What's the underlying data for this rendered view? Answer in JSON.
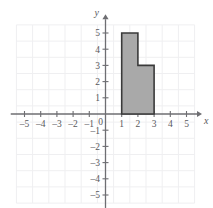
{
  "chart_data": {
    "type": "area",
    "title": "",
    "xlabel": "x",
    "ylabel": "y",
    "xlim": [
      -5.9,
      5.9
    ],
    "ylim": [
      -5.6,
      5.6
    ],
    "grid": true,
    "legend": "none",
    "x_ticks": [
      -5,
      -4,
      -3,
      -2,
      -1,
      1,
      2,
      3,
      4,
      5
    ],
    "y_ticks": [
      -5,
      -4,
      -3,
      -2,
      -1,
      1,
      2,
      3,
      4,
      5
    ],
    "x_tick_labels": [
      "–5",
      "–4",
      "–3",
      "–2",
      "–1",
      "1",
      "2",
      "3",
      "4",
      "5"
    ],
    "y_tick_labels": [
      "–5",
      "–4",
      "–3",
      "–2",
      "–1",
      "1",
      "2",
      "3",
      "4",
      "5"
    ],
    "origin_label": "0",
    "series": [
      {
        "name": "shaded-region",
        "type": "polygon",
        "fill_color": "#a9a9a9",
        "edge_color": "#3a3a3a",
        "vertices": [
          [
            1,
            0
          ],
          [
            1,
            5
          ],
          [
            2,
            5
          ],
          [
            2,
            3
          ],
          [
            3,
            3
          ],
          [
            3,
            0
          ]
        ]
      }
    ]
  },
  "axes": {
    "x_axis_label": "x",
    "y_axis_label": "y",
    "origin_label": "0"
  },
  "colors": {
    "grid": "#efeff1",
    "axis": "#6e6e72",
    "shape_fill": "#a9a9a9",
    "shape_stroke": "#3a3a3a",
    "text": "#58585c",
    "background": "#ffffff"
  }
}
